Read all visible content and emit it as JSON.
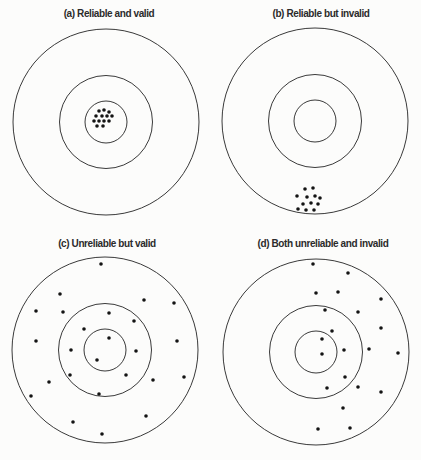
{
  "figure": {
    "name": "reliability-and-validity-targets",
    "colors": {
      "background": "#fcfcfb",
      "circle_stroke": "#3a3a3a",
      "dot_fill": "#141414",
      "title_text": "#2b2b2b"
    },
    "ring_radii": [
      93,
      46.5,
      21
    ],
    "dot_radius": 1.8,
    "panels": [
      {
        "key": "a",
        "title": "(a) Reliable and valid",
        "title_x": 109,
        "title_y": 17,
        "cx": 106,
        "cy": 122,
        "dots": [
          [
            99,
            111
          ],
          [
            104,
            110
          ],
          [
            109,
            112
          ],
          [
            96,
            116
          ],
          [
            102,
            116
          ],
          [
            107,
            116
          ],
          [
            112,
            116
          ],
          [
            94,
            121
          ],
          [
            99,
            121
          ],
          [
            104,
            121
          ],
          [
            109,
            121
          ],
          [
            97,
            126
          ],
          [
            103,
            126
          ]
        ]
      },
      {
        "key": "b",
        "title": "(b) Reliable but invalid",
        "title_x": 321,
        "title_y": 17,
        "cx": 315,
        "cy": 121,
        "dots": [
          [
            305,
            189
          ],
          [
            313,
            188
          ],
          [
            297,
            196
          ],
          [
            307,
            197
          ],
          [
            315,
            196
          ],
          [
            320,
            198
          ],
          [
            303,
            204
          ],
          [
            311,
            203
          ],
          [
            318,
            204
          ],
          [
            298,
            209
          ],
          [
            306,
            210
          ],
          [
            314,
            210
          ]
        ]
      },
      {
        "key": "c",
        "title": "(c) Unreliable but valid",
        "title_x": 107,
        "title_y": 247,
        "cx": 105,
        "cy": 350,
        "dots": [
          [
            101,
            264
          ],
          [
            60,
            294
          ],
          [
            144,
            300
          ],
          [
            174,
            303
          ],
          [
            36,
            311
          ],
          [
            63,
            312
          ],
          [
            109,
            313
          ],
          [
            134,
            321
          ],
          [
            84,
            329
          ],
          [
            109,
            338
          ],
          [
            36,
            341
          ],
          [
            177,
            341
          ],
          [
            71,
            350
          ],
          [
            136,
            351
          ],
          [
            97,
            360
          ],
          [
            70,
            375
          ],
          [
            126,
            375
          ],
          [
            49,
            382
          ],
          [
            153,
            380
          ],
          [
            184,
            377
          ],
          [
            31,
            396
          ],
          [
            99,
            394
          ],
          [
            146,
            416
          ],
          [
            73,
            422
          ],
          [
            102,
            434
          ]
        ]
      },
      {
        "key": "d",
        "title": "(d) Both unreliable and invalid",
        "title_x": 323,
        "title_y": 247,
        "cx": 316,
        "cy": 352,
        "dots": [
          [
            313,
            264
          ],
          [
            348,
            273
          ],
          [
            316,
            293
          ],
          [
            338,
            292
          ],
          [
            381,
            299
          ],
          [
            325,
            310
          ],
          [
            358,
            312
          ],
          [
            381,
            328
          ],
          [
            332,
            331
          ],
          [
            322,
            339
          ],
          [
            344,
            350
          ],
          [
            369,
            349
          ],
          [
            398,
            353
          ],
          [
            322,
            354
          ],
          [
            345,
            377
          ],
          [
            327,
            388
          ],
          [
            358,
            387
          ],
          [
            381,
            392
          ],
          [
            343,
            408
          ],
          [
            318,
            429
          ],
          [
            350,
            428
          ]
        ]
      }
    ]
  }
}
